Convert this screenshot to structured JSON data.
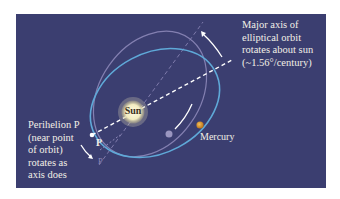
{
  "diagram": {
    "type": "orbital-precession",
    "colors": {
      "background": "#3b3e70",
      "current_orbit": "#5fa9d8",
      "previous_orbit": "#8c87b8",
      "axis": "#ffffff",
      "sun": "#f3ecc0",
      "mercury": "#d8962a",
      "previous_planet": "#9a96c0",
      "text": "#f2efe6"
    },
    "labels": {
      "major_axis": "Major axis of\nelliptical orbit\nrotates about sun\n(~1.56°/century)",
      "perihelion": "Perihelion P\n(near point\nof orbit)\nrotates as\naxis does",
      "sun": "Sun",
      "mercury": "Mercury",
      "perihelion_point": "P",
      "previous_perihelion_point": "P"
    },
    "elements": [
      {
        "name": "sun",
        "label": "Sun"
      },
      {
        "name": "current-orbit",
        "description": "blue elliptical orbit"
      },
      {
        "name": "previous-orbit",
        "description": "faint purple elliptical orbit (earlier orientation)"
      },
      {
        "name": "major-axis",
        "description": "dashed white line through perihelion and sun"
      },
      {
        "name": "previous-major-axis",
        "description": "faint dashed line (earlier orientation)"
      },
      {
        "name": "rotation-arrow",
        "description": "curved arrow showing axis rotation"
      },
      {
        "name": "perihelion-arrow",
        "description": "curved arrow showing perihelion movement"
      },
      {
        "name": "mercury",
        "label": "Mercury"
      }
    ]
  }
}
